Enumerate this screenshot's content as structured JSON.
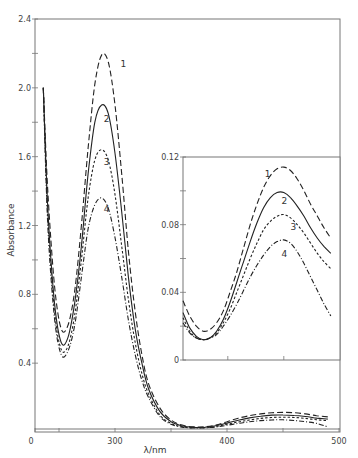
{
  "chart_data": [
    {
      "id": "main",
      "type": "line",
      "title": "",
      "xlabel": "λ/nm",
      "ylabel": "Absorbance",
      "xlim": [
        228,
        500
      ],
      "ylim": [
        0,
        2.4
      ],
      "x_ticks": [
        {
          "value": 228,
          "label": "0"
        },
        {
          "value": 250,
          "label": ""
        },
        {
          "value": 300,
          "label": "300"
        },
        {
          "value": 350,
          "label": ""
        },
        {
          "value": 400,
          "label": "400"
        },
        {
          "value": 450,
          "label": ""
        },
        {
          "value": 500,
          "label": "500"
        }
      ],
      "y_ticks": [
        {
          "value": 0.4,
          "label": "0.4"
        },
        {
          "value": 0.6,
          "label": ""
        },
        {
          "value": 0.8,
          "label": "0.8"
        },
        {
          "value": 1.0,
          "label": ""
        },
        {
          "value": 1.2,
          "label": "1.2"
        },
        {
          "value": 1.4,
          "label": ""
        },
        {
          "value": 1.6,
          "label": "1.6"
        },
        {
          "value": 1.8,
          "label": ""
        },
        {
          "value": 2.0,
          "label": "2.0"
        },
        {
          "value": 2.2,
          "label": ""
        },
        {
          "value": 2.4,
          "label": "2.4"
        }
      ],
      "grid": false,
      "legend": "curve numbers labelled inline",
      "series": [
        {
          "name": "1",
          "style": "long-dash",
          "label_at": [
            305,
            2.12
          ],
          "x": [
            236,
            240,
            246,
            252,
            258,
            264,
            270,
            276,
            282,
            288,
            294,
            300,
            306,
            312,
            318,
            324,
            330,
            340,
            350,
            360,
            370,
            380,
            390,
            400,
            410,
            420,
            430,
            440,
            450,
            460,
            470,
            480,
            490
          ],
          "y": [
            2.0,
            1.4,
            0.85,
            0.6,
            0.62,
            0.82,
            1.2,
            1.65,
            2.02,
            2.19,
            2.15,
            1.9,
            1.5,
            1.05,
            0.7,
            0.45,
            0.28,
            0.14,
            0.07,
            0.04,
            0.03,
            0.03,
            0.04,
            0.06,
            0.08,
            0.095,
            0.105,
            0.112,
            0.114,
            0.112,
            0.105,
            0.095,
            0.088
          ]
        },
        {
          "name": "2",
          "style": "solid",
          "label_at": [
            290,
            1.8
          ],
          "x": [
            236,
            240,
            246,
            252,
            258,
            264,
            270,
            276,
            282,
            288,
            294,
            300,
            306,
            312,
            318,
            324,
            330,
            340,
            350,
            360,
            370,
            380,
            390,
            400,
            410,
            420,
            430,
            440,
            450,
            460,
            470,
            480,
            490
          ],
          "y": [
            2.0,
            1.3,
            0.75,
            0.52,
            0.55,
            0.75,
            1.08,
            1.5,
            1.8,
            1.9,
            1.85,
            1.62,
            1.28,
            0.9,
            0.6,
            0.4,
            0.25,
            0.12,
            0.06,
            0.035,
            0.027,
            0.028,
            0.036,
            0.052,
            0.068,
            0.082,
            0.092,
            0.098,
            0.099,
            0.096,
            0.09,
            0.081,
            0.075
          ]
        },
        {
          "name": "3",
          "style": "short-dash",
          "label_at": [
            290,
            1.55
          ],
          "x": [
            236,
            240,
            246,
            252,
            258,
            264,
            270,
            276,
            282,
            288,
            294,
            300,
            306,
            312,
            318,
            324,
            330,
            340,
            350,
            360,
            370,
            380,
            390,
            400,
            410,
            420,
            430,
            440,
            450,
            460,
            470,
            480,
            490
          ],
          "y": [
            2.0,
            1.25,
            0.7,
            0.48,
            0.5,
            0.68,
            1.0,
            1.36,
            1.58,
            1.64,
            1.58,
            1.38,
            1.08,
            0.77,
            0.52,
            0.34,
            0.22,
            0.1,
            0.05,
            0.03,
            0.025,
            0.026,
            0.032,
            0.045,
            0.058,
            0.07,
            0.079,
            0.084,
            0.086,
            0.084,
            0.079,
            0.071,
            0.066
          ]
        },
        {
          "name": "4",
          "style": "dash-dot",
          "label_at": [
            290,
            1.28
          ],
          "x": [
            236,
            240,
            246,
            252,
            258,
            264,
            270,
            276,
            282,
            288,
            294,
            300,
            306,
            312,
            318,
            324,
            330,
            340,
            350,
            360,
            370,
            380,
            390,
            400,
            410,
            420,
            430,
            440,
            450,
            460,
            470,
            480,
            490
          ],
          "y": [
            2.0,
            1.2,
            0.66,
            0.45,
            0.47,
            0.62,
            0.9,
            1.18,
            1.32,
            1.36,
            1.3,
            1.13,
            0.9,
            0.65,
            0.45,
            0.3,
            0.2,
            0.09,
            0.045,
            0.028,
            0.023,
            0.024,
            0.029,
            0.039,
            0.05,
            0.059,
            0.066,
            0.07,
            0.071,
            0.067,
            0.06,
            0.05,
            0.03
          ]
        }
      ]
    },
    {
      "id": "inset",
      "type": "line",
      "title": "",
      "xlabel": "",
      "ylabel": "",
      "xlim": [
        360,
        500
      ],
      "ylim": [
        0,
        0.12
      ],
      "x_ticks": [
        {
          "value": 400,
          "label": ""
        },
        {
          "value": 450,
          "label": ""
        }
      ],
      "y_ticks": [
        {
          "value": 0,
          "label": "0"
        },
        {
          "value": 0.02,
          "label": ""
        },
        {
          "value": 0.04,
          "label": "0.04"
        },
        {
          "value": 0.06,
          "label": ""
        },
        {
          "value": 0.08,
          "label": "0.08"
        },
        {
          "value": 0.1,
          "label": ""
        },
        {
          "value": 0.12,
          "label": "0.12"
        }
      ],
      "grid": false,
      "series": [
        {
          "name": "1",
          "style": "long-dash",
          "label_at": [
            433,
            0.108
          ],
          "x": [
            360,
            366,
            372,
            378,
            384,
            390,
            396,
            402,
            408,
            414,
            420,
            426,
            432,
            438,
            444,
            450,
            456,
            462,
            468,
            474,
            480,
            486,
            492
          ],
          "y": [
            0.035,
            0.026,
            0.02,
            0.017,
            0.018,
            0.022,
            0.029,
            0.04,
            0.052,
            0.066,
            0.08,
            0.092,
            0.102,
            0.109,
            0.113,
            0.114,
            0.112,
            0.107,
            0.1,
            0.092,
            0.085,
            0.078,
            0.072
          ]
        },
        {
          "name": "2",
          "style": "solid",
          "label_at": [
            448,
            0.092
          ],
          "x": [
            360,
            366,
            372,
            378,
            384,
            390,
            396,
            402,
            408,
            414,
            420,
            426,
            432,
            438,
            444,
            450,
            456,
            462,
            468,
            474,
            480,
            486,
            492
          ],
          "y": [
            0.028,
            0.019,
            0.014,
            0.012,
            0.013,
            0.017,
            0.024,
            0.034,
            0.046,
            0.058,
            0.07,
            0.081,
            0.09,
            0.096,
            0.099,
            0.099,
            0.096,
            0.091,
            0.085,
            0.078,
            0.072,
            0.067,
            0.063
          ]
        },
        {
          "name": "3",
          "style": "short-dash",
          "label_at": [
            456,
            0.077
          ],
          "x": [
            360,
            366,
            372,
            378,
            384,
            390,
            396,
            402,
            408,
            414,
            420,
            426,
            432,
            438,
            444,
            450,
            456,
            462,
            468,
            474,
            480,
            486,
            492
          ],
          "y": [
            0.025,
            0.017,
            0.013,
            0.012,
            0.013,
            0.016,
            0.022,
            0.03,
            0.04,
            0.05,
            0.06,
            0.069,
            0.077,
            0.082,
            0.085,
            0.086,
            0.084,
            0.08,
            0.075,
            0.069,
            0.063,
            0.058,
            0.054
          ]
        },
        {
          "name": "4",
          "style": "dash-dot",
          "label_at": [
            448,
            0.061
          ],
          "x": [
            360,
            366,
            372,
            378,
            384,
            390,
            396,
            402,
            408,
            414,
            420,
            426,
            432,
            438,
            444,
            450,
            456,
            462,
            468,
            474,
            480,
            486,
            492
          ],
          "y": [
            0.022,
            0.016,
            0.013,
            0.012,
            0.013,
            0.015,
            0.02,
            0.026,
            0.033,
            0.041,
            0.049,
            0.056,
            0.062,
            0.067,
            0.07,
            0.071,
            0.069,
            0.064,
            0.057,
            0.049,
            0.041,
            0.033,
            0.026
          ]
        }
      ]
    }
  ],
  "styles": {
    "long-dash": "6,3",
    "solid": "",
    "short-dash": "2.5,2",
    "dash-dot": "5,2,1,2"
  },
  "colors": {
    "curve": "#222222",
    "axis": "#777777",
    "text": "#444444"
  }
}
